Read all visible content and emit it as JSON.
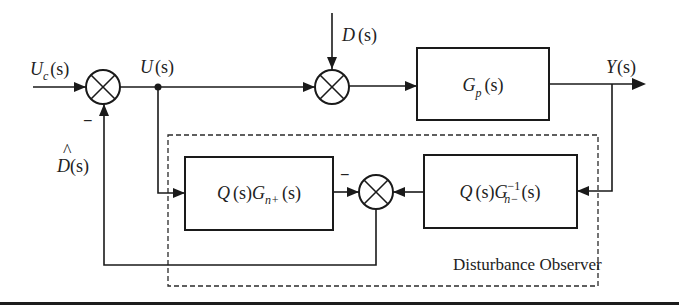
{
  "diagram": {
    "signals": {
      "reference": {
        "main": "U",
        "sub": "c",
        "arg": "(s)"
      },
      "control": {
        "main": "U",
        "arg": "(s)"
      },
      "disturbance": {
        "main": "D",
        "arg": "(s)"
      },
      "output": {
        "main": "Y",
        "arg": "(s)"
      },
      "estimated_disturbance": {
        "main": "D",
        "hat": "^",
        "arg": "(s)"
      }
    },
    "blocks": {
      "plant": {
        "main": "G",
        "sub": "p",
        "arg": "(s)"
      },
      "nominal_model": {
        "q": "Q",
        "qarg": "(s)",
        "main": "G",
        "sub": "n+",
        "arg": "(s)"
      },
      "inverse_model": {
        "q": "Q",
        "qarg": "(s)",
        "main": "G",
        "sup": "−1",
        "sub": "n−",
        "arg": "(s)"
      }
    },
    "signs": {
      "summer1_feedback": "−",
      "summer3_left": "−"
    },
    "group_label": "Disturbance Observer",
    "colors": {
      "stroke": "#1a1a1a",
      "background": "#ffffff"
    }
  }
}
